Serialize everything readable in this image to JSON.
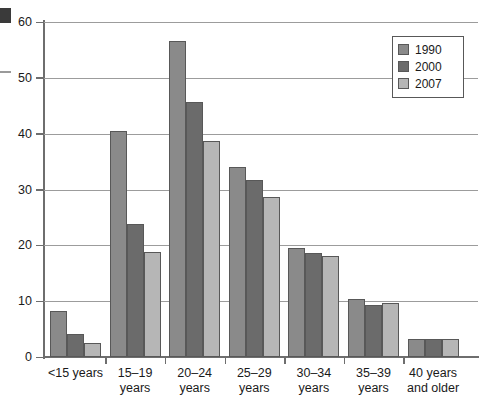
{
  "chart_data": {
    "type": "bar",
    "title": "",
    "xlabel": "",
    "ylabel": "",
    "ylim": [
      0,
      60
    ],
    "yticks": [
      0,
      10,
      20,
      30,
      40,
      50,
      60
    ],
    "grid": true,
    "legend_position": "top-right",
    "categories": [
      "<15 years",
      "15–19 years",
      "20–24 years",
      "25–29 years",
      "30–34 years",
      "35–39 years",
      "40 years and older"
    ],
    "category_lines": [
      [
        "<15 years"
      ],
      [
        "15–19",
        "years"
      ],
      [
        "20–24",
        "years"
      ],
      [
        "25–29",
        "years"
      ],
      [
        "30–34",
        "years"
      ],
      [
        "35–39",
        "years"
      ],
      [
        "40 years",
        "and older"
      ]
    ],
    "series": [
      {
        "name": "1990",
        "color": "#8a8a8a",
        "values": [
          8.2,
          40.5,
          56.6,
          34.0,
          19.5,
          10.4,
          3.2
        ]
      },
      {
        "name": "2000",
        "color": "#6b6b6b",
        "values": [
          4.2,
          23.9,
          45.7,
          31.7,
          18.6,
          9.4,
          3.2
        ]
      },
      {
        "name": "2007",
        "color": "#b6b6b6",
        "values": [
          2.5,
          18.8,
          38.7,
          28.6,
          18.1,
          9.6,
          3.3
        ]
      }
    ]
  },
  "legend": {
    "items": [
      {
        "label": "1990",
        "swatch": "series-1990-swatch"
      },
      {
        "label": "2000",
        "swatch": "series-2000-swatch"
      },
      {
        "label": "2007",
        "swatch": "series-2007-swatch"
      }
    ]
  },
  "axis": {
    "y_tick_labels": [
      "0",
      "10",
      "20",
      "30",
      "40",
      "50",
      "60"
    ]
  }
}
